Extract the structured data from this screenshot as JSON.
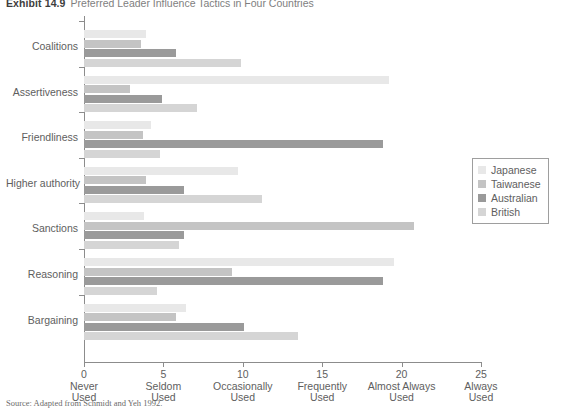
{
  "exhibit": {
    "number": "Exhibit 14.9",
    "title": "Preferred Leader Influence Tactics in Four Countries"
  },
  "source_note": "Source: Adapted from Schmidt and Yeh 1992.",
  "legend": {
    "position": "right",
    "items": [
      {
        "label": "Japanese",
        "color": "#e8e8e8"
      },
      {
        "label": "Taiwanese",
        "color": "#c4c4c4"
      },
      {
        "label": "Australian",
        "color": "#9a9a9a"
      },
      {
        "label": "British",
        "color": "#d5d5d5"
      }
    ]
  },
  "axis": {
    "ticks": [
      {
        "value": "0",
        "word1": "Never",
        "word2": "Used"
      },
      {
        "value": "5",
        "word1": "Seldom",
        "word2": "Used"
      },
      {
        "value": "10",
        "word1": "Occasionally",
        "word2": "Used"
      },
      {
        "value": "15",
        "word1": "Frequently",
        "word2": "Used"
      },
      {
        "value": "20",
        "word1": "Almost Always",
        "word2": "Used"
      },
      {
        "value": "25",
        "word1": "Always",
        "word2": "Used"
      }
    ]
  },
  "chart_data": {
    "type": "bar",
    "orientation": "horizontal",
    "title": "Preferred Leader Influence Tactics in Four Countries",
    "xlabel": "",
    "ylabel": "",
    "xlim": [
      0,
      25
    ],
    "grid": false,
    "legend_position": "right",
    "categories": [
      "Coalitions",
      "Assertiveness",
      "Friendliness",
      "Higher authority",
      "Sanctions",
      "Reasoning",
      "Bargaining"
    ],
    "series": [
      {
        "name": "Japanese",
        "color": "#e8e8e8",
        "values": [
          3.9,
          19.2,
          4.2,
          9.7,
          3.8,
          19.5,
          6.4
        ]
      },
      {
        "name": "Taiwanese",
        "color": "#c4c4c4",
        "values": [
          3.6,
          2.9,
          3.7,
          3.9,
          20.8,
          9.3,
          5.8
        ]
      },
      {
        "name": "Australian",
        "color": "#9a9a9a",
        "values": [
          5.8,
          4.9,
          18.8,
          6.3,
          6.3,
          18.8,
          10.1
        ]
      },
      {
        "name": "British",
        "color": "#d5d5d5",
        "values": [
          9.9,
          7.1,
          4.8,
          11.2,
          6.0,
          4.6,
          13.5
        ]
      }
    ]
  }
}
